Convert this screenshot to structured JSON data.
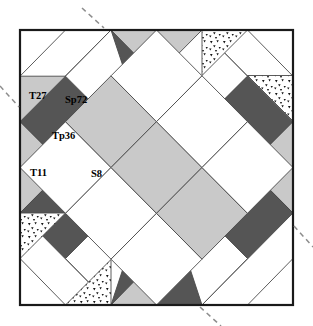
{
  "figure": {
    "square": {
      "x": 20,
      "y": 30,
      "width": 273,
      "height": 275
    },
    "grid_divisions": 6,
    "labels": [
      {
        "name": "T27",
        "text": "T27",
        "x": 37,
        "y": 95,
        "piece": "white-triangle"
      },
      {
        "name": "Sp72",
        "text": "Sp72",
        "x": 73,
        "y": 100,
        "piece": "white-parallelogram"
      },
      {
        "name": "Tp36",
        "text": "Tp36",
        "x": 58,
        "y": 136,
        "piece": "dark-parallelogram"
      },
      {
        "name": "T11",
        "text": "T11",
        "x": 36,
        "y": 172,
        "piece": "light-triangle"
      },
      {
        "name": "S8",
        "text": "S8",
        "x": 97,
        "y": 173,
        "piece": "white-square"
      }
    ],
    "colors": {
      "white": "#ffffff",
      "light_gray": "#c9c9c9",
      "mid_gray": "#b9b9b9",
      "dark_gray": "#555555",
      "stipple_background": "#ffffff",
      "stipple_dots": "#151515",
      "edge_stroke": "#4a4a4a",
      "frame_stroke": "#1a1a1a",
      "axis_dash": "#8d8d8d",
      "label_text": "#000000"
    },
    "fill_legend": [
      {
        "key": "white",
        "label": "white"
      },
      {
        "key": "light_gray",
        "label": "light gray"
      },
      {
        "key": "dark_gray",
        "label": "dark gray"
      },
      {
        "key": "stipple",
        "label": "stippled"
      }
    ],
    "axis_marks": [
      {
        "name": "axis-mark-top",
        "x1": 82,
        "y1": 8,
        "x2": 104,
        "y2": 28
      },
      {
        "name": "axis-mark-left",
        "x1": 0,
        "y1": 86,
        "x2": 19,
        "y2": 107
      },
      {
        "name": "axis-mark-right",
        "x1": 294,
        "y1": 226,
        "x2": 313,
        "y2": 247
      },
      {
        "name": "axis-mark-bottom",
        "x1": 200,
        "y1": 307,
        "x2": 221,
        "y2": 326
      }
    ],
    "pieces": [
      {
        "name": "tl-corner-white-tri-a",
        "fill": "white",
        "points": "20,30 111.0,30 20,121.7"
      },
      {
        "name": "tl-white-band-outer",
        "fill": "white",
        "points": "20,30 111.0,30 20,121.7"
      },
      {
        "name": "tl-dark-band",
        "fill": "dark_gray",
        "points": "20,121.7 65.5,76.2 111.0,121.7 65.5,167.2"
      },
      {
        "name": "tl-white-band-inner",
        "fill": "white",
        "points": "65.5,76.2 111.0,30 156.5,76.2 111.0,121.7"
      },
      {
        "name": "top-dark-left",
        "fill": "dark_gray",
        "points": "111.0,30 156.5,30 202.0,121.7 156.5,167.2"
      },
      {
        "name": "top-light-center",
        "fill": "light_gray",
        "points": "156.5,30 202.0,30 156.5,76.2 111.0,30"
      },
      {
        "name": "left-light-a",
        "fill": "light_gray",
        "points": "20,121.7 65.5,167.2 20,213.0"
      },
      {
        "name": "center-diamond-grid",
        "fill": "mixed",
        "points": "156.5,76.2 236.5,156.5 156.5,236.5 76.2,156.5"
      },
      {
        "name": "tr-stipple-tri-a",
        "fill": "stipple",
        "points": "202.0,30 247.5,30 247.5,75.5"
      },
      {
        "name": "tr-stipple-tri-b",
        "fill": "stipple",
        "points": "247.5,75.5 293,30 293,121.0"
      },
      {
        "name": "bl-stipple-tri-a",
        "fill": "stipple",
        "points": "20,213.0 65.5,258.5 20,305"
      },
      {
        "name": "bl-stipple-tri-b",
        "fill": "stipple",
        "points": "111.0,305 65.5,258.5 156.5,258.5"
      }
    ]
  }
}
